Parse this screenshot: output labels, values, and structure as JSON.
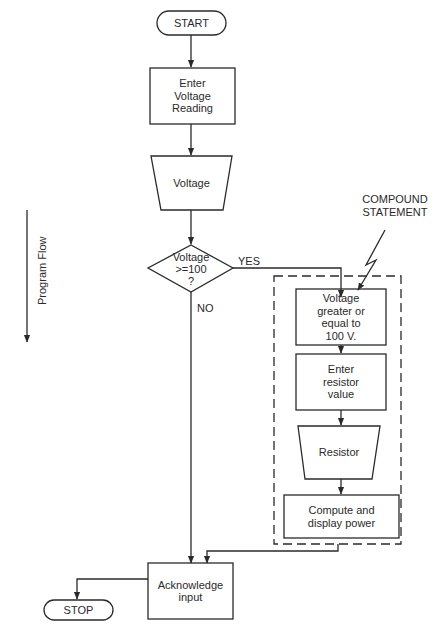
{
  "diagram": {
    "type": "flowchart",
    "side_label": "Program Flow",
    "nodes": {
      "start": {
        "shape": "terminator",
        "label": "START"
      },
      "enter_voltage": {
        "shape": "process",
        "label": "Enter\nVoltage\nReading"
      },
      "voltage_input": {
        "shape": "manual-input-trapezoid",
        "label": "Voltage"
      },
      "decision": {
        "shape": "decision",
        "label": "Voltage\n>=100\n?"
      },
      "voltage_ge": {
        "shape": "process",
        "label": "Voltage\ngreater or\nequal to\n100 V."
      },
      "enter_resistor": {
        "shape": "process",
        "label": "Enter\nresistor\nvalue"
      },
      "resistor_input": {
        "shape": "manual-input-trapezoid",
        "label": "Resistor"
      },
      "compute": {
        "shape": "process",
        "label": "Compute and\ndisplay power"
      },
      "acknowledge": {
        "shape": "process",
        "label": "Acknowledge\ninput"
      },
      "stop": {
        "shape": "terminator",
        "label": "STOP"
      }
    },
    "edge_labels": {
      "yes": "YES",
      "no": "NO"
    },
    "annotation": {
      "label": "COMPOUND\nSTATEMENT",
      "target": "dashed group box"
    },
    "edges": [
      [
        "start",
        "enter_voltage"
      ],
      [
        "enter_voltage",
        "voltage_input"
      ],
      [
        "voltage_input",
        "decision"
      ],
      [
        "decision",
        "voltage_ge",
        "YES"
      ],
      [
        "decision",
        "acknowledge",
        "NO"
      ],
      [
        "voltage_ge",
        "enter_resistor"
      ],
      [
        "enter_resistor",
        "resistor_input"
      ],
      [
        "resistor_input",
        "compute"
      ],
      [
        "compute",
        "acknowledge"
      ],
      [
        "acknowledge",
        "stop"
      ]
    ]
  }
}
